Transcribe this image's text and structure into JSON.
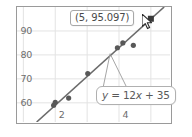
{
  "chart_data": {
    "type": "scatter",
    "title": "",
    "xlabel": "",
    "ylabel": "",
    "xlim": [
      0.8,
      5.6
    ],
    "ylim": [
      52,
      100
    ],
    "grid": true,
    "legend": "none",
    "x_ticks": [
      "2",
      "4"
    ],
    "x_tick_values": [
      2,
      4
    ],
    "y_ticks": [
      "90",
      "80",
      "70",
      "60"
    ],
    "y_tick_values": [
      90,
      80,
      70,
      60
    ],
    "points": [
      {
        "x": 1.95,
        "y": 59.0
      },
      {
        "x": 2.0,
        "y": 60.2
      },
      {
        "x": 2.42,
        "y": 62.0
      },
      {
        "x": 3.02,
        "y": 72.2
      },
      {
        "x": 3.95,
        "y": 83.0
      },
      {
        "x": 4.12,
        "y": 85.0
      },
      {
        "x": 4.45,
        "y": 84.0
      },
      {
        "x": 5.0,
        "y": 95.097
      }
    ],
    "highlighted_point": {
      "x": 5,
      "y": 95.097
    },
    "fit_line": {
      "label": "y = 12x + 35",
      "slope": 12,
      "intercept": 35
    },
    "series_color": "#585858",
    "line_color": "#6b6b6b",
    "grid_color": "#e3e3e3",
    "frame_color": "#9a9a9a",
    "tick_label_color": "#6d6d6d"
  },
  "tooltip": {
    "text": "(5, 95.097)",
    "name": "data-point-tooltip"
  },
  "equation_callout": {
    "y_symbol": "y",
    "equals": " = ",
    "coefficient": "12",
    "x_symbol": "x",
    "plus_constant": " + 35",
    "full_text": "y = 12x + 35"
  },
  "cursor": {
    "icon": "arrow-cursor",
    "x": 142,
    "y": 14
  }
}
